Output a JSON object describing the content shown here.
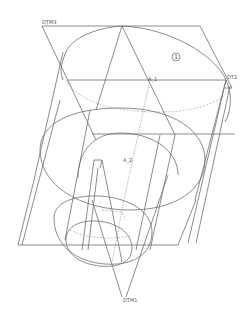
{
  "drawing": {
    "colors": {
      "background": "#ffffff",
      "line": "#6e6e6e",
      "hidden": "#9a9a9a"
    },
    "datum_planes": [
      {
        "id": "dtm3",
        "label": "DTM3"
      },
      {
        "id": "dtm2",
        "label": "DT2"
      },
      {
        "id": "dtm1",
        "label": "DTM1"
      }
    ],
    "axes": [
      {
        "id": "a1",
        "label": "A_1"
      },
      {
        "id": "a2",
        "label": "A_2"
      }
    ],
    "callout": {
      "label": "1"
    }
  }
}
